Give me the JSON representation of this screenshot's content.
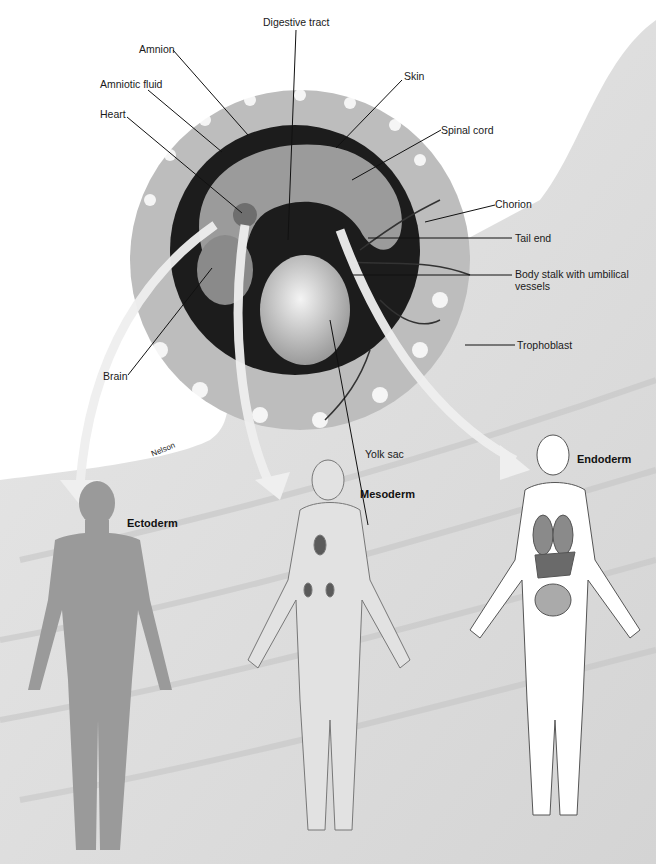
{
  "figure": {
    "background": "#ffffff",
    "tissue_color": "#d9d9d9",
    "cavity_color": "#1c1c1c",
    "arrow_color": "#ececec",
    "line_color": "#111111"
  },
  "embryo_labels": [
    {
      "id": "digestive-tract",
      "text": "Digestive tract"
    },
    {
      "id": "amnion",
      "text": "Amnion"
    },
    {
      "id": "amniotic-fluid",
      "text": "Amniotic fluid"
    },
    {
      "id": "heart",
      "text": "Heart"
    },
    {
      "id": "skin",
      "text": "Skin"
    },
    {
      "id": "spinal-cord",
      "text": "Spinal cord"
    },
    {
      "id": "chorion",
      "text": "Chorion"
    },
    {
      "id": "tail-end",
      "text": "Tail end"
    },
    {
      "id": "body-stalk",
      "text": "Body stalk with umbilical vessels"
    },
    {
      "id": "trophoblast",
      "text": "Trophoblast"
    },
    {
      "id": "brain",
      "text": "Brain"
    },
    {
      "id": "yolk-sac",
      "text": "Yolk sac"
    }
  ],
  "germ_layers": [
    {
      "id": "ectoderm",
      "text": "Ectoderm"
    },
    {
      "id": "mesoderm",
      "text": "Mesoderm"
    },
    {
      "id": "endoderm",
      "text": "Endoderm"
    }
  ],
  "credit": "Nelson"
}
